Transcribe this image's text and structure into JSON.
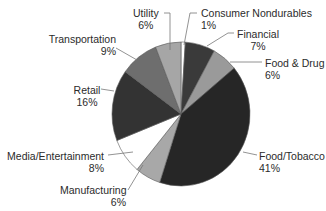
{
  "chart_data": {
    "type": "pie",
    "title": "",
    "start_angle_deg": 0,
    "direction": "clockwise",
    "slices": [
      {
        "label": "Consumer Nondurables",
        "value": 1,
        "pct_label": "1%",
        "color": "#ffffff"
      },
      {
        "label": "Financial",
        "value": 7,
        "pct_label": "7%",
        "color": "#3a3a3a"
      },
      {
        "label": "Food & Drug",
        "value": 6,
        "pct_label": "6%",
        "color": "#9a9a9a"
      },
      {
        "label": "Food/Tobacco",
        "value": 41,
        "pct_label": "41%",
        "color": "#262626"
      },
      {
        "label": "Manufacturing",
        "value": 6,
        "pct_label": "6%",
        "color": "#a8a8a8"
      },
      {
        "label": "Media/Entertainment",
        "value": 8,
        "pct_label": "8%",
        "color": "#ffffff"
      },
      {
        "label": "Retail",
        "value": 16,
        "pct_label": "16%",
        "color": "#333333"
      },
      {
        "label": "Transportation",
        "value": 9,
        "pct_label": "9%",
        "color": "#6e6e6e"
      },
      {
        "label": "Utility",
        "value": 6,
        "pct_label": "6%",
        "color": "#a6a6a6"
      }
    ],
    "legend": "none (direct leader-line labels)"
  },
  "labels": {
    "consumer_nondurables": {
      "name": "Consumer Nondurables",
      "pct": "1%"
    },
    "financial": {
      "name": "Financial",
      "pct": "7%"
    },
    "food_drug": {
      "name": "Food & Drug",
      "pct": "6%"
    },
    "food_tobacco": {
      "name": "Food/Tobacco",
      "pct": "41%"
    },
    "manufacturing": {
      "name": "Manufacturing",
      "pct": "6%"
    },
    "media": {
      "name": "Media/Entertainment",
      "pct": "8%"
    },
    "retail": {
      "name": "Retail",
      "pct": "16%"
    },
    "transportation": {
      "name": "Transportation",
      "pct": "9%"
    },
    "utility": {
      "name": "Utility",
      "pct": "6%"
    }
  }
}
